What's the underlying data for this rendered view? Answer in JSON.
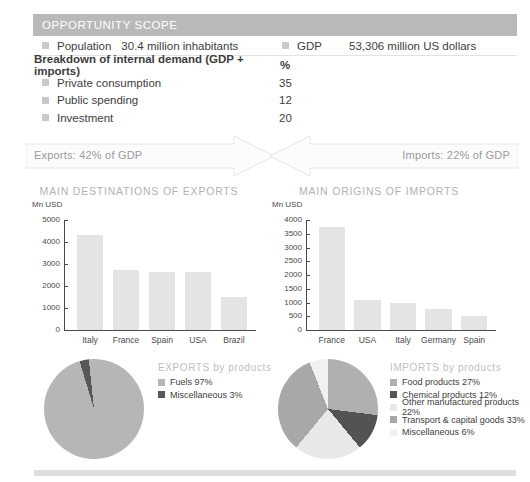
{
  "scope": {
    "header_title": "OPPORTUNITY SCOPE",
    "population_label": "Population",
    "population_value": "30.4 million inhabitants",
    "gdp_label": "GDP",
    "gdp_value": "53,306 million US dollars",
    "breakdown_title": "Breakdown of internal demand (GDP + imports)",
    "breakdown_unit": "%",
    "breakdown_rows": [
      {
        "label": "Private consumption",
        "value": "35"
      },
      {
        "label": "Public spending",
        "value": "12"
      },
      {
        "label": "Investment",
        "value": "20"
      }
    ]
  },
  "flows": {
    "exports_label": "Exports: 42% of GDP",
    "imports_label": "Imports: 22% of GDP"
  },
  "chart_data": [
    {
      "type": "bar",
      "title": "MAIN DESTINATIONS OF EXPORTS",
      "ylabel": "Mn USD",
      "xlabel": "",
      "categories": [
        "Italy",
        "France",
        "Spain",
        "USA",
        "Brazil"
      ],
      "values": [
        4300,
        2750,
        2650,
        2650,
        1500
      ],
      "yticks": [
        "0",
        "1000",
        "2000",
        "3000",
        "4000",
        "5000"
      ],
      "ylim": [
        0,
        5000
      ],
      "grid": false,
      "legend": "none",
      "bar_color": "#e4e4e4"
    },
    {
      "type": "bar",
      "title": "MAIN ORIGINS OF IMPORTS",
      "ylabel": "Mn USD",
      "xlabel": "",
      "categories": [
        "France",
        "USA",
        "Italy",
        "Germany",
        "Spain"
      ],
      "values": [
        3750,
        1100,
        1000,
        750,
        520
      ],
      "yticks": [
        "0",
        "500",
        "1000",
        "1500",
        "2000",
        "2500",
        "3000",
        "3500",
        "4000"
      ],
      "ylim": [
        0,
        4000
      ],
      "grid": false,
      "legend": "none",
      "bar_color": "#e4e4e4"
    },
    {
      "type": "pie",
      "title": "EXPORTS by products",
      "legend_position": "right",
      "labels": [
        "Fuels",
        "Miscellaneous"
      ],
      "values": [
        97,
        3
      ],
      "value_labels": [
        "Fuels 97%",
        "Miscellaneous 3%"
      ],
      "colors": [
        "#b6b6b6",
        "#575757"
      ]
    },
    {
      "type": "pie",
      "title": "IMPORTS by products",
      "legend_position": "right",
      "labels": [
        "Food products",
        "Chemical products",
        "Other manufactured products",
        "Transport & capital goods",
        "Miscellaneous"
      ],
      "values": [
        27,
        12,
        22,
        33,
        6
      ],
      "value_labels": [
        "Food products 27%",
        "Chemical products 12%",
        "Other manufactured products 22%",
        "Transport & capital goods 33%",
        "Miscellaneous 6%"
      ],
      "colors": [
        "#b0b0b0",
        "#535353",
        "#e8e8e8",
        "#a8a8a8",
        "#f1f1f1"
      ]
    }
  ],
  "theme": {
    "header_bg": "#b9b9b9",
    "bar_fill": "#e4e4e4",
    "muted_text": "#b2b2b2",
    "body_text": "#3d3d3d"
  }
}
